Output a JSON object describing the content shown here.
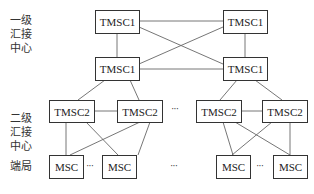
{
  "levels": {
    "level1": [
      "一级",
      "汇接",
      "中心"
    ],
    "level2": [
      "二级",
      "汇接",
      "中心"
    ],
    "end": "端局"
  },
  "nodes": {
    "t1_top_left": "TMSC1",
    "t1_top_right": "TMSC1",
    "t1_mid_left": "TMSC1",
    "t1_mid_right": "TMSC1",
    "t2_left_a": "TMSC2",
    "t2_left_b": "TMSC2",
    "t2_right_a": "TMSC2",
    "t2_right_b": "TMSC2",
    "msc_left_a": "MSC",
    "msc_left_b": "MSC",
    "msc_right_a": "MSC",
    "msc_right_b": "MSC"
  },
  "ellipsis": "···",
  "colors": {
    "line": "#555555",
    "border": "#333333"
  }
}
